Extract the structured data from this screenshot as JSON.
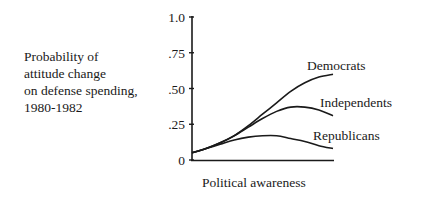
{
  "chart_data": {
    "type": "line",
    "title": "",
    "ylabel": "Probability of\nattitude change\non defense spending,\n1980-1982",
    "xlabel": "Political awareness",
    "ylim": [
      0,
      1.0
    ],
    "xlim": [
      0,
      1
    ],
    "yticks": [
      0,
      0.25,
      0.5,
      0.75,
      1.0
    ],
    "ytick_labels": [
      "0",
      ".25",
      ".50",
      ".75",
      "1.0"
    ],
    "grid": false,
    "x": [
      0,
      0.1,
      0.2,
      0.3,
      0.4,
      0.5,
      0.6,
      0.7,
      0.8,
      0.9,
      1.0
    ],
    "series": [
      {
        "name": "Democrats",
        "values": [
          0.05,
          0.08,
          0.12,
          0.17,
          0.24,
          0.32,
          0.4,
          0.48,
          0.54,
          0.58,
          0.6
        ]
      },
      {
        "name": "Independents",
        "values": [
          0.05,
          0.08,
          0.12,
          0.17,
          0.23,
          0.29,
          0.34,
          0.37,
          0.37,
          0.35,
          0.31
        ]
      },
      {
        "name": "Republicans",
        "values": [
          0.05,
          0.08,
          0.11,
          0.14,
          0.16,
          0.17,
          0.17,
          0.15,
          0.13,
          0.1,
          0.08
        ]
      }
    ]
  }
}
